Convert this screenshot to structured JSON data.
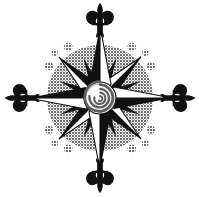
{
  "image": {
    "title": "Compass Rose",
    "kind": "decorative-illustration",
    "width": 199,
    "height": 197,
    "background_color": "#ffffff"
  },
  "colors": {
    "background": "#ffffff",
    "disc_gray": "#8c8c8c",
    "disc_gray_light": "#9a9a9a",
    "ink_black": "#111111",
    "star_white": "#ffffff",
    "dot_gray": "#8f8f8f",
    "spiral_gray": "#7d7d7d",
    "spiral_light": "#dedede"
  },
  "compass": {
    "center_x": 100,
    "center_y": 98,
    "disc_radius": 53,
    "major_point_length": 70,
    "minor_point_length": 40,
    "hub_radius": 17,
    "points": [
      {
        "name": "north",
        "label": "N",
        "angle_deg": 0,
        "kind": "major"
      },
      {
        "name": "northeast",
        "label": "NE",
        "angle_deg": 45,
        "kind": "major"
      },
      {
        "name": "east",
        "label": "E",
        "angle_deg": 90,
        "kind": "major"
      },
      {
        "name": "southeast",
        "label": "SE",
        "angle_deg": 135,
        "kind": "major"
      },
      {
        "name": "south",
        "label": "S",
        "angle_deg": 180,
        "kind": "major"
      },
      {
        "name": "southwest",
        "label": "SW",
        "angle_deg": 225,
        "kind": "major"
      },
      {
        "name": "west",
        "label": "W",
        "angle_deg": 270,
        "kind": "major"
      },
      {
        "name": "northwest",
        "label": "NW",
        "angle_deg": 315,
        "kind": "major"
      },
      {
        "name": "nne",
        "label": "NNE",
        "angle_deg": 22.5,
        "kind": "minor"
      },
      {
        "name": "ene",
        "label": "ENE",
        "angle_deg": 67.5,
        "kind": "minor"
      },
      {
        "name": "ese",
        "label": "ESE",
        "angle_deg": 112.5,
        "kind": "minor"
      },
      {
        "name": "sse",
        "label": "SSE",
        "angle_deg": 157.5,
        "kind": "minor"
      },
      {
        "name": "ssw",
        "label": "SSW",
        "angle_deg": 202.5,
        "kind": "minor"
      },
      {
        "name": "wsw",
        "label": "WSW",
        "angle_deg": 247.5,
        "kind": "minor"
      },
      {
        "name": "wnw",
        "label": "WNW",
        "angle_deg": 292.5,
        "kind": "minor"
      },
      {
        "name": "nnw",
        "label": "NNW",
        "angle_deg": 337.5,
        "kind": "minor"
      }
    ],
    "fleurs": [
      {
        "name": "fleur-north",
        "angle_deg": 0,
        "distance": 78
      },
      {
        "name": "fleur-east",
        "angle_deg": 90,
        "distance": 78
      },
      {
        "name": "fleur-south",
        "angle_deg": 180,
        "distance": 78
      },
      {
        "name": "fleur-west",
        "angle_deg": 270,
        "distance": 78
      }
    ],
    "dot_clusters": [
      {
        "name": "dots-northwest",
        "angle_deg": 315,
        "dots": [
          {
            "offset_deg": -13,
            "distance": 60,
            "r": 4.0
          },
          {
            "offset_deg": 0,
            "distance": 64,
            "r": 3.2
          },
          {
            "offset_deg": 13,
            "distance": 60,
            "r": 4.4
          }
        ]
      },
      {
        "name": "dots-northeast",
        "angle_deg": 45,
        "dots": [
          {
            "offset_deg": -13,
            "distance": 60,
            "r": 4.4
          },
          {
            "offset_deg": 0,
            "distance": 64,
            "r": 3.2
          },
          {
            "offset_deg": 13,
            "distance": 60,
            "r": 4.0
          }
        ]
      },
      {
        "name": "dots-southeast",
        "angle_deg": 135,
        "dots": [
          {
            "offset_deg": -13,
            "distance": 60,
            "r": 4.0
          },
          {
            "offset_deg": 0,
            "distance": 64,
            "r": 3.4
          },
          {
            "offset_deg": 13,
            "distance": 60,
            "r": 4.4
          }
        ]
      },
      {
        "name": "dots-southwest",
        "angle_deg": 225,
        "dots": [
          {
            "offset_deg": -13,
            "distance": 60,
            "r": 4.4
          },
          {
            "offset_deg": 0,
            "distance": 64,
            "r": 3.2
          },
          {
            "offset_deg": 13,
            "distance": 60,
            "r": 4.0
          }
        ]
      }
    ],
    "hub": {
      "name": "spiral-medallion",
      "turns": 3.1,
      "outer_radius": 16,
      "stroke_width": 2.6
    }
  }
}
